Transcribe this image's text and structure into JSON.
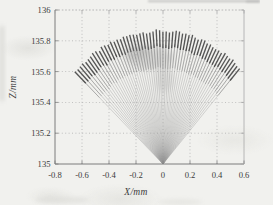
{
  "figure": {
    "paper_color": "#f1f1ee",
    "axis_color": "#7d7d7d",
    "box_color": "#a8a8a8",
    "grid_color": "#9f9f9f",
    "text_color": "#3b3b3b",
    "ray_color": "#999999",
    "ray_mid_color": "#7a7a7a",
    "ray_tip_color": "#414141",
    "smudge_color": "#8f8f8f"
  },
  "chart_data": {
    "type": "line",
    "title": "",
    "xlabel": "X/mm",
    "ylabel": "Z/mm",
    "xlim": [
      -0.8,
      0.6
    ],
    "ylim": [
      135,
      136
    ],
    "xticks": [
      -0.8,
      -0.6,
      -0.4,
      -0.2,
      0,
      0.2,
      0.4,
      0.6
    ],
    "xtick_labels": [
      "-0.8",
      "-0.6",
      "-0.4",
      "-0.2",
      "0",
      "0.2",
      "0.4",
      "0.6"
    ],
    "yticks": [
      135,
      135.2,
      135.4,
      135.6,
      135.8,
      136
    ],
    "ytick_labels": [
      "135",
      "135.2",
      "135.4",
      "135.6",
      "135.8",
      "136"
    ],
    "grid": true,
    "legend": null,
    "ray_fan": {
      "vertex": [
        0,
        135
      ],
      "num_rays": 56,
      "angle_start_deg": -47.5,
      "angle_end_deg": 42.5,
      "radius_base_mm": 0.8635,
      "radius_slope_mm_per_deg": -0.00045,
      "radius_jitter_mm": 0.011,
      "mid_start_fraction": 0.72,
      "tip_start_fraction": 0.875,
      "tip_z_center_mm": 135.86,
      "tip_left_mm": [
        -0.65,
        135.6
      ],
      "tip_right_mm": [
        0.56,
        135.62
      ]
    }
  }
}
